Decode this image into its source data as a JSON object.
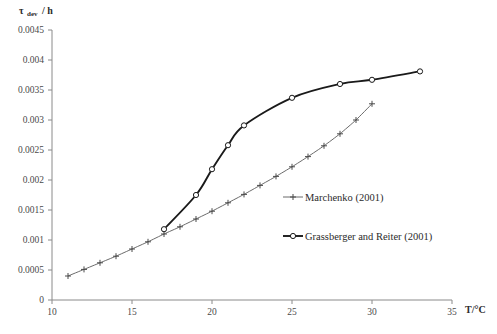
{
  "chart_data": {
    "type": "line",
    "title": "",
    "xlabel": "T/°C",
    "ylabel": "τdev / h",
    "ylabel_main": "τ",
    "ylabel_subscript": "dev",
    "ylabel_unit": "/ h",
    "xlim": [
      10,
      35
    ],
    "ylim": [
      0,
      0.0045
    ],
    "xticks": [
      10,
      15,
      20,
      25,
      30,
      35
    ],
    "xtick_labels": [
      "10",
      "15",
      "20",
      "25",
      "30",
      "35"
    ],
    "yticks": [
      0,
      0.0005,
      0.001,
      0.0015,
      0.002,
      0.0025,
      0.003,
      0.0035,
      0.004,
      0.0045
    ],
    "ytick_labels": [
      "0",
      "0.0005",
      "0.001",
      "0.0015",
      "0.002",
      "0.0025",
      "0.003",
      "0.0035",
      "0.004",
      "0.0045"
    ],
    "grid": false,
    "legend_position": "center-right",
    "series": [
      {
        "name": "Marchenko (2001)",
        "marker": "plus",
        "line_style": "thin",
        "x": [
          11,
          12,
          13,
          14,
          15,
          16,
          17,
          18,
          19,
          20,
          21,
          22,
          23,
          24,
          25,
          26,
          27,
          28,
          29,
          30
        ],
        "y": [
          0.0004,
          0.00051,
          0.00062,
          0.00073,
          0.00085,
          0.00097,
          0.0011,
          0.00122,
          0.00135,
          0.00148,
          0.00162,
          0.00176,
          0.00191,
          0.00206,
          0.00222,
          0.00239,
          0.00257,
          0.00277,
          0.003,
          0.00327
        ]
      },
      {
        "name": "Grassberger and Reiter (2001)",
        "marker": "circle",
        "line_style": "thick",
        "x": [
          17,
          19,
          20,
          21,
          22,
          25,
          28,
          30,
          33
        ],
        "y": [
          0.00118,
          0.00175,
          0.00218,
          0.00258,
          0.00291,
          0.00337,
          0.0036,
          0.00367,
          0.00381
        ]
      }
    ],
    "legend_entries": [
      {
        "label": "Marchenko (2001)",
        "marker": "plus"
      },
      {
        "label": "Grassberger and Reiter (2001)",
        "marker": "circle"
      }
    ]
  }
}
